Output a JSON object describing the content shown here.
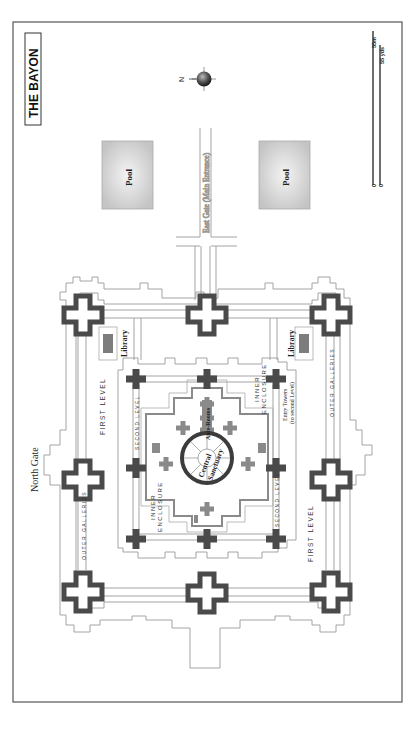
{
  "title": "THE BAYON",
  "compass": {
    "label": "N",
    "icon": "compass-rose-icon"
  },
  "scale": {
    "metric_max": "55m",
    "metric_min": "0",
    "imperial_max": "55 yds",
    "imperial_min": "0"
  },
  "pools": [
    {
      "label": "Pool"
    },
    {
      "label": "Pool"
    }
  ],
  "gates": {
    "east": "East Gate (Main Entrance)",
    "north": "North Gate"
  },
  "libraries": [
    {
      "label": "Library"
    },
    {
      "label": "Library"
    }
  ],
  "labels": {
    "outer_galleries_1": "OUTER GALLERIES",
    "outer_galleries_2": "OUTER GALLERIES",
    "first_level_1": "FIRST LEVEL",
    "first_level_2": "FIRST LEVEL",
    "second_level_1": "SECOND LEVEL",
    "second_level_2": "SECOND LEVEL",
    "inner_enclosure_1a": "INNER",
    "inner_enclosure_1b": "ENCLOSURE",
    "inner_enclosure_2a": "INNER",
    "inner_enclosure_2b": "ENCLOSURE",
    "entry_towers_a": "Entry Towers",
    "entry_towers_b": "(to second Level)",
    "ante_rooms": "Ante-Rooms",
    "central_a": "Central",
    "central_b": "Sanctuary"
  },
  "colors": {
    "tower": "#4a4a4a",
    "inner_tower": "#8a8a8a",
    "library": "#7d7d7d",
    "outline": "#9a9a9a",
    "frame": "#555555"
  }
}
